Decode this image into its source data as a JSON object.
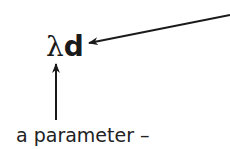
{
  "expression": {
    "scalar": "λ",
    "vector": "d"
  },
  "caption": "a parameter –",
  "arrows": [
    {
      "name": "arrow-to-vector",
      "from": [
        230,
        15
      ],
      "to": [
        88,
        43
      ]
    },
    {
      "name": "arrow-to-scalar",
      "from": [
        56,
        120
      ],
      "to": [
        56,
        63
      ]
    }
  ],
  "colors": {
    "ink": "#1a1a1a",
    "background": "#ffffff"
  }
}
